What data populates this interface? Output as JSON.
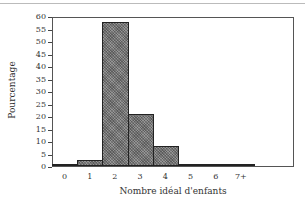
{
  "chart_data": {
    "type": "bar",
    "title": "",
    "xlabel": "Nombre idéal d'enfants",
    "ylabel": "Pourcentage",
    "categories": [
      "0",
      "1",
      "2",
      "3",
      "4",
      "5",
      "6",
      "7+"
    ],
    "values": [
      1,
      2.5,
      57.5,
      21,
      8,
      0.5,
      0.2,
      0.2
    ],
    "ylim": [
      0,
      60
    ],
    "yticks": [
      0,
      5,
      10,
      15,
      20,
      25,
      30,
      35,
      40,
      45,
      50,
      55,
      60
    ],
    "grid": false,
    "legend": null
  }
}
